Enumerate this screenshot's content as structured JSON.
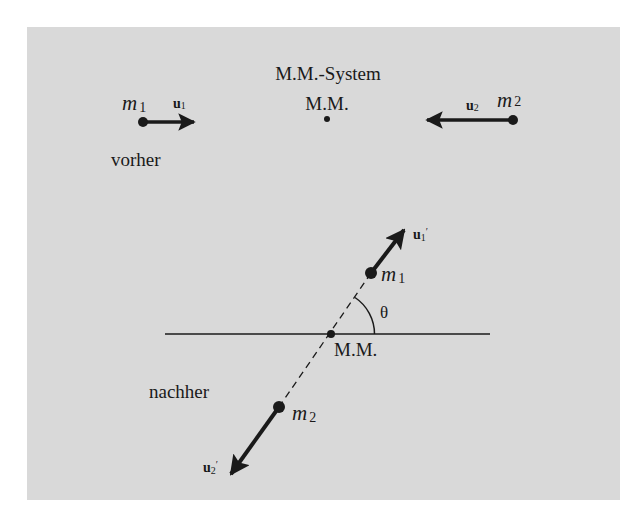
{
  "diagram": {
    "title": "M.M.-System",
    "background_color": "#d9d9d9",
    "ink_color": "#1a1a1a",
    "before": {
      "label": "vorher",
      "center_label": "M.M.",
      "mass1": {
        "symbol": "m",
        "sub": "1",
        "velocity_symbol": "u",
        "velocity_sub": "1",
        "direction": "right"
      },
      "mass2": {
        "symbol": "m",
        "sub": "2",
        "velocity_symbol": "u",
        "velocity_sub": "2",
        "direction": "left"
      }
    },
    "after": {
      "label": "nachher",
      "center_label": "M.M.",
      "angle_label": "θ",
      "mass1": {
        "symbol": "m",
        "sub": "1",
        "velocity_symbol": "u",
        "velocity_sub": "1",
        "prime": "′",
        "direction": "up-right"
      },
      "mass2": {
        "symbol": "m",
        "sub": "2",
        "velocity_symbol": "u",
        "velocity_sub": "2",
        "prime": "′",
        "direction": "down-left"
      }
    }
  }
}
